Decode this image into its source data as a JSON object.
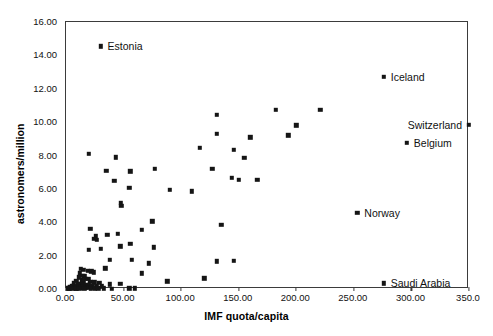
{
  "chart_data": {
    "type": "scatter",
    "title": "",
    "xlabel": "IMF quota/capita",
    "ylabel": "astronomers/million",
    "xlim": [
      0,
      350
    ],
    "ylim": [
      0,
      16
    ],
    "xticks": [
      0,
      50,
      100,
      150,
      200,
      250,
      300,
      350
    ],
    "xticklabels": [
      "0.00",
      "50.00",
      "100.00",
      "150.00",
      "200.00",
      "250.00",
      "300.00",
      "350.0"
    ],
    "yticks": [
      0,
      2,
      4,
      6,
      8,
      10,
      12,
      14,
      16
    ],
    "yticklabels": [
      "0.00",
      "2.00",
      "4.00",
      "6.00",
      "8.00",
      "10.00",
      "12.00",
      "14.00",
      "16.00"
    ],
    "grid": false,
    "legend": false,
    "marker": "square",
    "marker_color": "#151515",
    "frame_color": "#3b3b3b",
    "points": [
      {
        "x": 30.0,
        "y": 14.55
      },
      {
        "x": 276.0,
        "y": 12.7
      },
      {
        "x": 350.0,
        "y": 9.85
      },
      {
        "x": 296.0,
        "y": 8.75
      },
      {
        "x": 276.0,
        "y": 0.35
      },
      {
        "x": 253.0,
        "y": 4.55
      },
      {
        "x": 221.0,
        "y": 10.75
      },
      {
        "x": 182.0,
        "y": 10.75
      },
      {
        "x": 200.0,
        "y": 9.8
      },
      {
        "x": 131.0,
        "y": 10.45
      },
      {
        "x": 160.0,
        "y": 9.1
      },
      {
        "x": 193.0,
        "y": 9.2
      },
      {
        "x": 131.0,
        "y": 9.3
      },
      {
        "x": 155.0,
        "y": 7.85
      },
      {
        "x": 116.0,
        "y": 8.45
      },
      {
        "x": 146.0,
        "y": 8.35
      },
      {
        "x": 20.0,
        "y": 8.1
      },
      {
        "x": 127.0,
        "y": 7.2
      },
      {
        "x": 150.0,
        "y": 6.55
      },
      {
        "x": 166.0,
        "y": 6.55
      },
      {
        "x": 43.0,
        "y": 7.9
      },
      {
        "x": 35.0,
        "y": 7.1
      },
      {
        "x": 56.0,
        "y": 7.05
      },
      {
        "x": 77.0,
        "y": 7.2
      },
      {
        "x": 109.0,
        "y": 5.85
      },
      {
        "x": 144.0,
        "y": 6.65
      },
      {
        "x": 55.0,
        "y": 6.05
      },
      {
        "x": 42.0,
        "y": 6.5
      },
      {
        "x": 90.0,
        "y": 5.95
      },
      {
        "x": 48.0,
        "y": 5.0
      },
      {
        "x": 47.5,
        "y": 5.15
      },
      {
        "x": 75.0,
        "y": 4.05
      },
      {
        "x": 66.0,
        "y": 3.55
      },
      {
        "x": 21.0,
        "y": 3.6
      },
      {
        "x": 36.0,
        "y": 3.25
      },
      {
        "x": 45.0,
        "y": 3.3
      },
      {
        "x": 26.0,
        "y": 3.15
      },
      {
        "x": 24.0,
        "y": 3.0
      },
      {
        "x": 27.0,
        "y": 2.95
      },
      {
        "x": 56.0,
        "y": 2.7
      },
      {
        "x": 47.0,
        "y": 2.55
      },
      {
        "x": 76.0,
        "y": 2.5
      },
      {
        "x": 20.0,
        "y": 2.35
      },
      {
        "x": 30.0,
        "y": 2.4
      },
      {
        "x": 135.0,
        "y": 3.85
      },
      {
        "x": 131.0,
        "y": 1.65
      },
      {
        "x": 57.0,
        "y": 1.75
      },
      {
        "x": 72.0,
        "y": 1.55
      },
      {
        "x": 146.0,
        "y": 1.7
      },
      {
        "x": 38.0,
        "y": 1.75
      },
      {
        "x": 66.0,
        "y": 0.95
      },
      {
        "x": 34.0,
        "y": 1.25
      },
      {
        "x": 13.0,
        "y": 1.2
      },
      {
        "x": 15.0,
        "y": 1.15
      },
      {
        "x": 19.0,
        "y": 1.1
      },
      {
        "x": 22.0,
        "y": 1.05
      },
      {
        "x": 24.0,
        "y": 1.0
      },
      {
        "x": 12.0,
        "y": 0.95
      },
      {
        "x": 14.0,
        "y": 0.8
      },
      {
        "x": 16.0,
        "y": 0.75
      },
      {
        "x": 11.0,
        "y": 0.7
      },
      {
        "x": 17.0,
        "y": 0.62
      },
      {
        "x": 19.5,
        "y": 0.6
      },
      {
        "x": 13.5,
        "y": 0.52
      },
      {
        "x": 9.0,
        "y": 0.48
      },
      {
        "x": 15.5,
        "y": 0.45
      },
      {
        "x": 21.0,
        "y": 0.42
      },
      {
        "x": 24.5,
        "y": 0.4
      },
      {
        "x": 29.0,
        "y": 0.38
      },
      {
        "x": 7.0,
        "y": 0.35
      },
      {
        "x": 10.5,
        "y": 0.3
      },
      {
        "x": 12.5,
        "y": 0.28
      },
      {
        "x": 14.5,
        "y": 0.26
      },
      {
        "x": 17.5,
        "y": 0.24
      },
      {
        "x": 20.0,
        "y": 0.22
      },
      {
        "x": 23.0,
        "y": 0.2
      },
      {
        "x": 26.5,
        "y": 0.18
      },
      {
        "x": 31.0,
        "y": 0.16
      },
      {
        "x": 5.0,
        "y": 0.2
      },
      {
        "x": 6.5,
        "y": 0.16
      },
      {
        "x": 8.0,
        "y": 0.14
      },
      {
        "x": 9.5,
        "y": 0.12
      },
      {
        "x": 11.0,
        "y": 0.11
      },
      {
        "x": 13.0,
        "y": 0.1
      },
      {
        "x": 15.0,
        "y": 0.09
      },
      {
        "x": 17.0,
        "y": 0.08
      },
      {
        "x": 19.0,
        "y": 0.07
      },
      {
        "x": 3.5,
        "y": 0.1
      },
      {
        "x": 4.5,
        "y": 0.08
      },
      {
        "x": 6.0,
        "y": 0.07
      },
      {
        "x": 7.5,
        "y": 0.06
      },
      {
        "x": 9.0,
        "y": 0.05
      },
      {
        "x": 2.5,
        "y": 0.05
      },
      {
        "x": 22.0,
        "y": 0.06
      },
      {
        "x": 25.0,
        "y": 0.05
      },
      {
        "x": 28.0,
        "y": 0.05
      },
      {
        "x": 33.0,
        "y": 0.05
      },
      {
        "x": 38.0,
        "y": 0.28
      },
      {
        "x": 47.0,
        "y": 0.3
      },
      {
        "x": 55.0,
        "y": 0.05
      },
      {
        "x": 60.0,
        "y": 0.05
      },
      {
        "x": 88.0,
        "y": 0.45
      },
      {
        "x": 120.0,
        "y": 0.65
      },
      {
        "x": 1.5,
        "y": 0.03
      },
      {
        "x": 3.0,
        "y": 0.02
      },
      {
        "x": 5.5,
        "y": 0.02
      },
      {
        "x": 8.5,
        "y": 0.02
      },
      {
        "x": 11.5,
        "y": 0.02
      },
      {
        "x": 16.0,
        "y": 0.02
      },
      {
        "x": 21.5,
        "y": 0.02
      },
      {
        "x": 40.0,
        "y": 0.02
      }
    ],
    "annotations": [
      {
        "label": "Estonia",
        "x": 30.0,
        "y": 14.55,
        "side": "right"
      },
      {
        "label": "Iceland",
        "x": 276.0,
        "y": 12.7,
        "side": "right"
      },
      {
        "label": "Switzerland",
        "x": 350.0,
        "y": 9.85,
        "side": "left"
      },
      {
        "label": "Belgium",
        "x": 296.0,
        "y": 8.75,
        "side": "right"
      },
      {
        "label": "Norway",
        "x": 253.0,
        "y": 4.55,
        "side": "right"
      },
      {
        "label": "Saudi Arabia",
        "x": 276.0,
        "y": 0.35,
        "side": "right"
      }
    ]
  }
}
